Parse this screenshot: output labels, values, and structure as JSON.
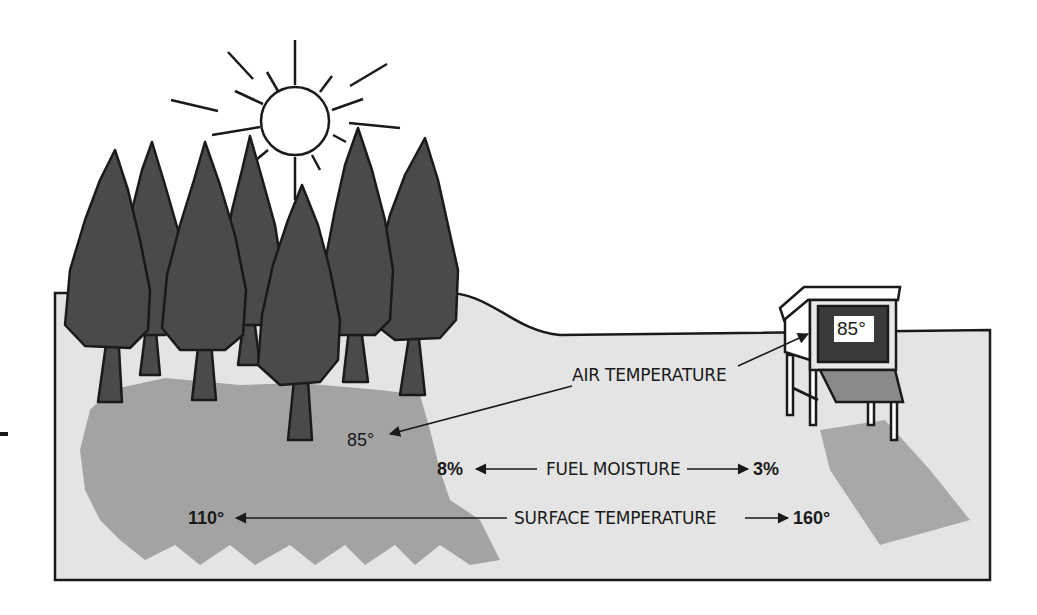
{
  "diagram": {
    "type": "illustration",
    "colors": {
      "ground": "#e4e4e4",
      "shadow": "#a3a3a3",
      "tree": "#4a4a4a",
      "outline": "#1a1a1a",
      "shelter_panel": "#3a3a3a"
    },
    "labels": {
      "air_temperature": "AIR TEMPERATURE",
      "fuel_moisture": "FUEL MOISTURE",
      "surface_temperature": "SURFACE TEMPERATURE"
    },
    "values": {
      "shelter_reading": "85°",
      "forest_air_temp": "85°",
      "forest_fuel_moisture": "8%",
      "open_fuel_moisture": "3%",
      "forest_surface_temp": "110°",
      "open_surface_temp": "160°"
    },
    "icons": [
      "sun-icon",
      "tree-icon",
      "weather-shelter-icon",
      "arrow-icon"
    ]
  }
}
